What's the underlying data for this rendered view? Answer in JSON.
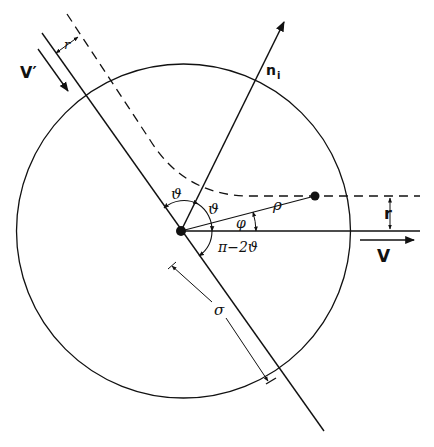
{
  "diagram": {
    "type": "scattering-geometry",
    "labels": {
      "v_prime": "V′",
      "v": "V",
      "r_top": "r",
      "r_right": "r",
      "n_i": "n",
      "n_i_sub": "i",
      "theta_left": "ϑ",
      "theta_right": "ϑ",
      "phi": "φ",
      "rho": "ρ",
      "pi_minus_2theta": "π−2ϑ",
      "sigma": "σ"
    },
    "colors": {
      "stroke": "#111111",
      "background": "#ffffff"
    },
    "elements": [
      "circle of radius σ centered at scattering center",
      "incoming velocity V′ along inclined line",
      "outgoing velocity V along horizontal line",
      "dashed trajectory offset by impact parameter r",
      "normal vector n_i",
      "angles ϑ, ϑ, φ, π−2ϑ",
      "distance ρ to particle"
    ]
  }
}
